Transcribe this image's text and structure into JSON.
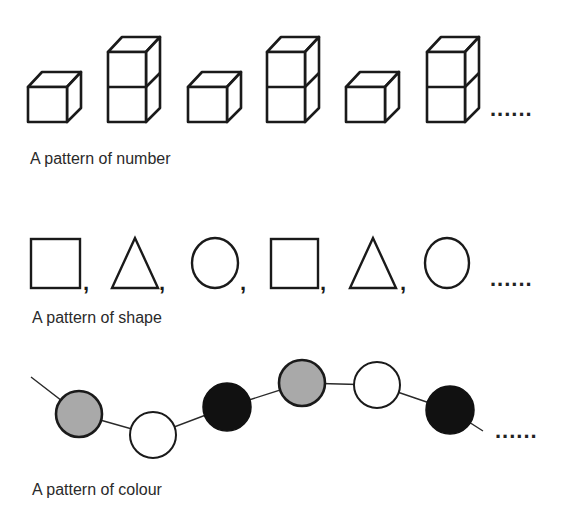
{
  "sections": [
    {
      "id": "number",
      "label": "A pattern of number",
      "sequence": [
        1,
        2,
        1,
        2,
        1,
        2
      ],
      "continuation": "......"
    },
    {
      "id": "shape",
      "label": "A pattern of shape",
      "sequence": [
        "square",
        "triangle",
        "circle",
        "square",
        "triangle",
        "circle"
      ],
      "separator": ",",
      "continuation": "......"
    },
    {
      "id": "colour",
      "label": "A pattern of colour",
      "sequence": [
        "grey",
        "white",
        "black",
        "grey",
        "white",
        "black"
      ],
      "continuation": "......"
    }
  ],
  "colors": {
    "stroke": "#1a1a1a",
    "grey": "#a9a9a9",
    "white": "#ffffff",
    "black": "#111111"
  }
}
